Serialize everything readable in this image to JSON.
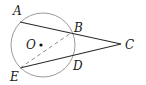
{
  "diagram": {
    "colors": {
      "background": "#ffffff",
      "circle": "#9a9a9a",
      "lines": "#2a2a2a",
      "dashed": "#8a8a8a",
      "text": "#1a1a1a"
    },
    "circle": {
      "label": "O",
      "cx": 43,
      "cy": 45,
      "r": 32
    },
    "points": {
      "A": {
        "label": "A",
        "x": 20,
        "y": 22
      },
      "B": {
        "label": "B",
        "x": 71,
        "y": 33
      },
      "C": {
        "label": "C",
        "x": 121,
        "y": 44
      },
      "D": {
        "label": "D",
        "x": 72,
        "y": 57
      },
      "E": {
        "label": "E",
        "x": 20,
        "y": 68
      },
      "O": {
        "label": "O",
        "x": 43,
        "y": 45
      }
    },
    "segments": [
      {
        "from": "A",
        "to": "C",
        "style": "solid"
      },
      {
        "from": "E",
        "to": "C",
        "style": "solid"
      },
      {
        "from": "E",
        "to": "B",
        "style": "dashed"
      }
    ]
  }
}
